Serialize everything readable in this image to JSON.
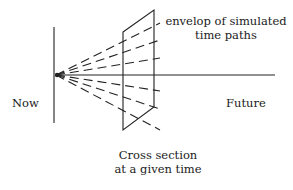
{
  "diagram": {
    "labels": {
      "envelope_line1": "envelop of simulated",
      "envelope_line2": "time paths",
      "now": "Now",
      "future": "Future",
      "cross_section_line1": "Cross section",
      "cross_section_line2": "at a given time"
    },
    "colors": {
      "stroke": "#222222",
      "background": "#ffffff"
    }
  }
}
